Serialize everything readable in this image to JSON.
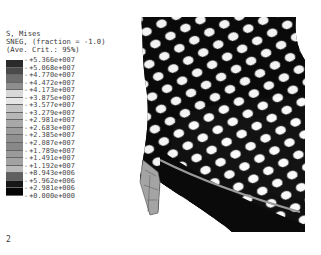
{
  "header": {
    "line1": "S, Mises",
    "line2": "SNEG, (fraction = -1.0)",
    "line3": "(Ave. Crit.: 95%)"
  },
  "legend": {
    "values": [
      "+5.366e+007",
      "+5.068e+007",
      "+4.770e+007",
      "+4.472e+007",
      "+4.173e+007",
      "+3.875e+007",
      "+3.577e+007",
      "+3.279e+007",
      "+2.981e+007",
      "+2.683e+007",
      "+2.385e+007",
      "+2.087e+007",
      "+1.789e+007",
      "+1.491e+007",
      "+1.192e+007",
      "+8.943e+006",
      "+5.962e+006",
      "+2.981e+006",
      "+0.000e+000"
    ],
    "colors": [
      "#2a2a2a",
      "#4a4a4a",
      "#6e6e6e",
      "#8e8e8e",
      "#d8d8d8",
      "#e6e6e6",
      "#c4c4c4",
      "#b6b6b6",
      "#a8a8a8",
      "#9c9c9c",
      "#909090",
      "#888888",
      "#9a9a9a",
      "#a2a2a2",
      "#b8b8b8",
      "#606060",
      "#161616",
      "#050505"
    ]
  },
  "step_label": "2",
  "model": {
    "description": "Stress contour of stent-like lattice mesh (von Mises)",
    "fill": "#0a0a0a",
    "hole_color": "#ffffff",
    "mid_gray": "#8a8a8a",
    "light_gray": "#bcbcbc"
  }
}
